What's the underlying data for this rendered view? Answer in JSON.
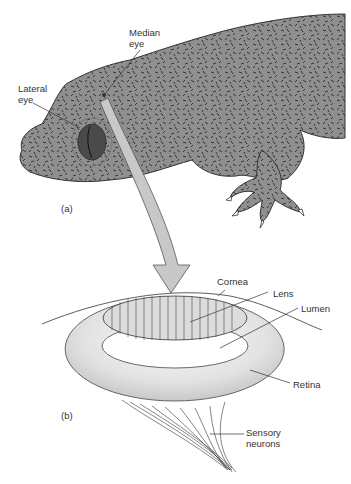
{
  "figure": {
    "panel_a": {
      "label": "(a)",
      "callouts": {
        "median_eye": {
          "line1": "Median",
          "line2": "eye"
        },
        "lateral_eye": {
          "line1": "Lateral",
          "line2": "eye"
        }
      }
    },
    "panel_b": {
      "label": "(b)",
      "callouts": {
        "cornea": "Cornea",
        "lens": "Lens",
        "lumen": "Lumen",
        "retina": "Retina",
        "sensory_neurons": {
          "line1": "Sensory",
          "line2": "neurons"
        }
      }
    },
    "colors": {
      "skin": "#8f8f8f",
      "skin_spots": "#2a2a2a",
      "eye": "#4a4a4a",
      "arrow": "#c8c8c8",
      "retina": "#e6e6e6",
      "lens": "#dcdcdc",
      "text": "#333333"
    }
  }
}
